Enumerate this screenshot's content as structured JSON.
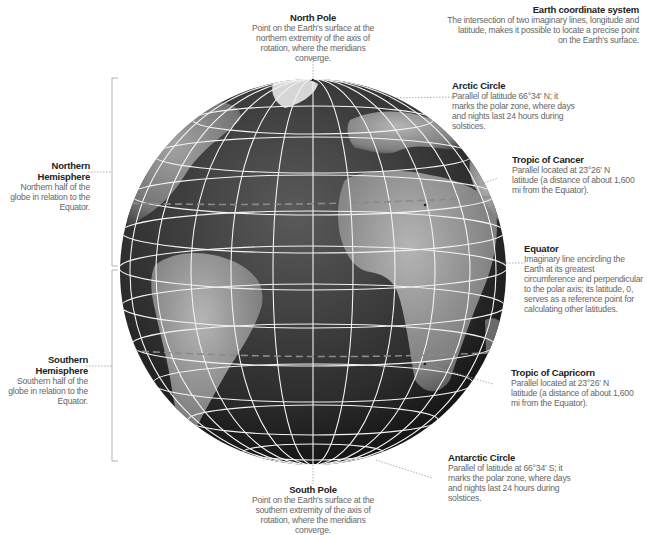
{
  "title": {
    "heading": "Earth coordinate system",
    "description": "The intersection of two imaginary lines, longitude and latitude, makes it possible to locate a precise point on the Earth's surface."
  },
  "labels": {
    "north_pole": {
      "title": "North Pole",
      "description": "Point on the Earth's surface at the northern extremity of the axis of rotation, where the meridians converge."
    },
    "arctic_circle": {
      "title": "Arctic Circle",
      "description": "Parallel of latitude 66°34' N; it marks the polar zone, where days and nights last 24 hours during solstices."
    },
    "tropic_of_cancer": {
      "title": "Tropic of Cancer",
      "description": "Parallel located at 23°26' N latitude (a distance of about 1,600 mi from the Equator)."
    },
    "equator": {
      "title": "Equator",
      "description": "Imaginary line encircling the Earth at its greatest circumference and perpendicular to the polar axis; its latitude, 0, serves as a reference point for calculating other latitudes."
    },
    "tropic_of_capricorn": {
      "title": "Tropic of Capricorn",
      "description": "Parallel located at 23°26' N latitude (a distance of about 1,600 mi from the Equator)."
    },
    "antarctic_circle": {
      "title": "Antarctic Circle",
      "description": "Parallel of latitude at 66°34' S; it marks the polar zone, where days and nights last 24 hours during solstices."
    },
    "south_pole": {
      "title": "South Pole",
      "description": "Point on the Earth's surface at the southern extremity of the axis of rotation, where the meridians converge."
    },
    "northern_hemisphere": {
      "title": "Northern Hemisphere",
      "description": "Northern half of the globe in relation to the Equator."
    },
    "southern_hemisphere": {
      "title": "Southern Hemisphere",
      "description": "Southern half of the globe in relation to the Equator."
    }
  },
  "colors": {
    "ocean": "#2b2b2b",
    "land": "#8a8a8a",
    "grid": "#f2f2f2",
    "tropic_dash": "#777777",
    "leader": "#999999"
  }
}
